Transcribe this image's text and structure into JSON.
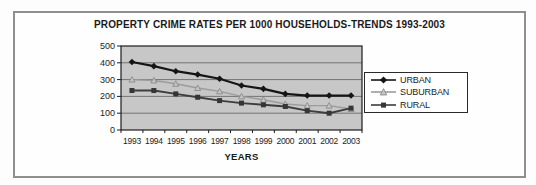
{
  "chart_data": {
    "type": "line",
    "title": "PROPERTY CRIME RATES PER 1000 HOUSEHOLDS-TRENDS 1993-2003",
    "xlabel": "YEARS",
    "ylabel": "",
    "ylim": [
      0,
      500
    ],
    "yticks": [
      0,
      100,
      200,
      300,
      400,
      500
    ],
    "grid": "horizontal",
    "legend_position": "right",
    "plot_bg": "#c7c7c7",
    "categories": [
      "1993",
      "1994",
      "1995",
      "1996",
      "1997",
      "1998",
      "1999",
      "2000",
      "2001",
      "2002",
      "2003"
    ],
    "series": [
      {
        "name": "URBAN",
        "marker": "diamond",
        "color": "#151515",
        "marker_fill": "#151515",
        "values": [
          405,
          380,
          350,
          330,
          305,
          265,
          245,
          215,
          205,
          205,
          205
        ]
      },
      {
        "name": "SUBURBAN",
        "marker": "triangle",
        "color": "#9b9b9b",
        "marker_fill": "#c4c4c4",
        "values": [
          300,
          295,
          275,
          250,
          230,
          200,
          180,
          155,
          145,
          145,
          125
        ]
      },
      {
        "name": "RURAL",
        "marker": "square",
        "color": "#3d3d3d",
        "marker_fill": "#353535",
        "values": [
          235,
          235,
          215,
          195,
          175,
          160,
          150,
          140,
          115,
          100,
          130
        ]
      }
    ]
  }
}
